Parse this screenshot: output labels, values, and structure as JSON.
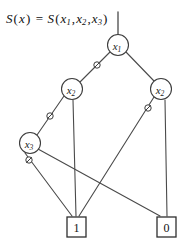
{
  "figure": {
    "kind": "binary-decision-diagram",
    "width": 177,
    "height": 245,
    "background_color": "#ffffff",
    "line_color": "#4a4a4a",
    "node_fill_color": "#ffffff",
    "node_stroke_color": "#3d3d3d"
  },
  "caption": {
    "full_text": "S(x) = S(x1,x2,x3)",
    "lhs_function": "S",
    "lhs_arg": "x",
    "equals": "=",
    "rhs_function": "S",
    "rhs_args": [
      "x1",
      "x2",
      "x3"
    ]
  },
  "nodes": [
    {
      "id": "n1",
      "label": "x",
      "subscript": "1",
      "cx": 118,
      "cy": 45,
      "r": 10.5,
      "shape": "circle"
    },
    {
      "id": "n2l",
      "label": "x",
      "subscript": "2",
      "cx": 72,
      "cy": 89,
      "r": 10.5,
      "shape": "circle"
    },
    {
      "id": "n2r",
      "label": "x",
      "subscript": "2",
      "cx": 161,
      "cy": 89,
      "r": 10.5,
      "shape": "circle"
    },
    {
      "id": "n3",
      "label": "x",
      "subscript": "3",
      "cx": 30,
      "cy": 143,
      "r": 10.5,
      "shape": "circle"
    }
  ],
  "terminals": [
    {
      "id": "t1",
      "label": "1",
      "x": 67,
      "y": 217,
      "w": 19,
      "h": 20,
      "shape": "square"
    },
    {
      "id": "t0",
      "label": "0",
      "x": 157,
      "y": 217,
      "w": 19,
      "h": 20,
      "shape": "square"
    }
  ],
  "root_stem": {
    "x": 118,
    "y_top": 12,
    "y_bottom": 35
  },
  "edges": [
    {
      "id": "e-n1-n2l",
      "from": "n1",
      "to": "n2l",
      "x1": 110,
      "y1": 52,
      "x2": 80,
      "y2": 82,
      "complemented": true,
      "marker_x": 97,
      "marker_y": 65
    },
    {
      "id": "e-n1-n2r",
      "from": "n1",
      "to": "n2r",
      "x1": 126,
      "y1": 52,
      "x2": 154,
      "y2": 81,
      "complemented": false
    },
    {
      "id": "e-n2l-n3",
      "from": "n2l",
      "to": "n3",
      "x1": 64,
      "y1": 96,
      "x2": 37,
      "y2": 135,
      "complemented": true,
      "marker_x": 50,
      "marker_y": 116
    },
    {
      "id": "e-n2l-t1",
      "from": "n2l",
      "to": "t1",
      "x1": 73,
      "y1": 100,
      "x2": 76,
      "y2": 216,
      "complemented": false
    },
    {
      "id": "e-n2r-t0",
      "from": "n2r",
      "to": "t0",
      "x1": 165,
      "y1": 100,
      "x2": 167,
      "y2": 216,
      "complemented": false
    },
    {
      "id": "e-n2r-t1",
      "from": "n2r",
      "to": "t1",
      "x1": 154,
      "y1": 97,
      "x2": 79,
      "y2": 216,
      "complemented": true,
      "marker_x": 148,
      "marker_y": 108
    },
    {
      "id": "e-n3-t0",
      "from": "n3",
      "to": "t0",
      "x1": 38,
      "y1": 149,
      "x2": 160,
      "y2": 216,
      "complemented": false
    },
    {
      "id": "e-n3-t1",
      "from": "n3",
      "to": "t1",
      "x1": 25,
      "y1": 153,
      "x2": 72,
      "y2": 216,
      "complemented": true,
      "marker_x": 29,
      "marker_y": 160
    }
  ],
  "markers": {
    "complement_symbol": "circle-with-slash",
    "radius": 3.2
  }
}
